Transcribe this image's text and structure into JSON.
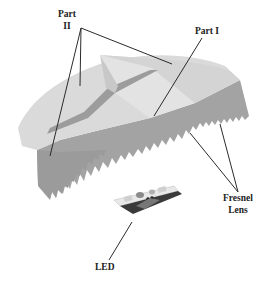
{
  "diagram": {
    "type": "3D schematic of LED with Fresnel lens",
    "labels": {
      "part2": [
        "Part",
        "II"
      ],
      "part1": "Part I",
      "fresnel": [
        "Fresnel",
        "Lens"
      ],
      "led": "LED"
    },
    "colors": {
      "top_surface": "#d9d9d9",
      "top_surface_light": "#e2e2e2",
      "side_wall": "#a6a6a6",
      "side_wall_dark": "#8f8f8f",
      "groove": "#9a9a9a",
      "leader_line": "#2b2b2b",
      "label_text": "#222222",
      "board": "#e6e6e6",
      "board_edge": "#333333",
      "pad": "#c8c8c8"
    }
  }
}
